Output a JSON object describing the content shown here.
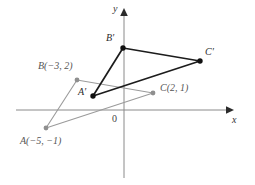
{
  "figure": {
    "type": "geometry-diagram",
    "width": 255,
    "height": 185,
    "background": "#ffffff"
  },
  "axes": {
    "x_label": "x",
    "y_label": "y",
    "origin_label": "0",
    "origin_px": [
      124,
      110
    ],
    "units_per_px": 15.5,
    "x_axis": {
      "x1": 16,
      "y1": 110,
      "x2": 230,
      "y2": 110,
      "arrow": "right"
    },
    "y_axis": {
      "x1": 124,
      "y1": 178,
      "x2": 124,
      "y2": 12,
      "arrow": "up"
    },
    "axis_color": "#8a8a8a",
    "arrow_color": "#2b2b2b"
  },
  "colors": {
    "preimage_stroke": "#9b9b9b",
    "preimage_point": "#8f8f8f",
    "image_stroke": "#1c1c1c",
    "image_point": "#111111",
    "axis": "#8a8a8a",
    "text_dark": "#2b2b2b",
    "text_gray": "#555555"
  },
  "shapes": {
    "preimage": {
      "name": "triangle-ABC",
      "style": "gray",
      "vertices": [
        {
          "id": "A",
          "label": "A(−5, −1)",
          "coord": [
            -5,
            -1
          ],
          "px": [
            46,
            128
          ],
          "label_px": [
            20,
            142
          ]
        },
        {
          "id": "B",
          "label": "B(−3, 2)",
          "coord": [
            -3,
            2
          ],
          "px": [
            77,
            80
          ],
          "label_px": [
            38,
            67
          ]
        },
        {
          "id": "C",
          "label": "C(2, 1)",
          "coord": [
            2,
            1
          ],
          "px": [
            153,
            93
          ],
          "label_px": [
            160,
            88
          ]
        }
      ]
    },
    "image": {
      "name": "triangle-A-prime-B-prime-C-prime",
      "style": "black",
      "vertices": [
        {
          "id": "A'",
          "label": "A′",
          "px": [
            93,
            96
          ],
          "label_px": [
            79,
            92
          ]
        },
        {
          "id": "B'",
          "label": "B′",
          "px": [
            123,
            48
          ],
          "label_px": [
            106,
            38
          ]
        },
        {
          "id": "C'",
          "label": "C′",
          "px": [
            200,
            61
          ],
          "label_px": [
            205,
            52
          ]
        }
      ]
    }
  }
}
